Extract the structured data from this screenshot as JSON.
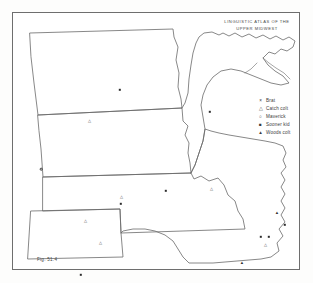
{
  "figure": {
    "title_line1": "LINGUISTIC  ATLAS  OF  THE",
    "title_line2": "UPPER  MIDWEST",
    "caption": "Fig. 51.4",
    "frame_color": "#6e6e6e",
    "ink_color": "#555555",
    "background": "#ffffff"
  },
  "legend": {
    "items": [
      {
        "symbol": "×",
        "glyph_kind": "cross",
        "label": "Brat"
      },
      {
        "symbol": "△",
        "glyph_kind": "triangle-open",
        "label": "Catch colt"
      },
      {
        "symbol": "○",
        "glyph_kind": "circle-open",
        "label": "Maverick"
      },
      {
        "symbol": "■",
        "glyph_kind": "square-filled",
        "label": "Sooner kid"
      },
      {
        "symbol": "▲",
        "glyph_kind": "triangle-filled",
        "label": "Woods colt"
      }
    ]
  },
  "map": {
    "region": "Upper Midwest",
    "states": [
      "North Dakota",
      "South Dakota",
      "Nebraska",
      "Kansas",
      "Minnesota",
      "Iowa"
    ],
    "water_features": [
      "Lake Superior"
    ],
    "borders": [
      "Canada"
    ]
  },
  "chart_data": {
    "type": "scatter",
    "title": "LINGUISTIC ATLAS OF THE UPPER MIDWEST",
    "xlabel": "",
    "ylabel": "",
    "series": [
      {
        "name": "Brat",
        "symbol": "×",
        "count": 1
      },
      {
        "name": "Catch colt",
        "symbol": "△",
        "count": 9
      },
      {
        "name": "Maverick",
        "symbol": "○",
        "count": 1
      },
      {
        "name": "Sooner kid",
        "symbol": "■",
        "count": 8
      },
      {
        "name": "Woods colt",
        "symbol": "▲",
        "count": 4
      }
    ],
    "points": [
      {
        "series": "Sooner kid",
        "x": 107,
        "y": 77,
        "state": "North Dakota"
      },
      {
        "series": "Catch colt",
        "x": 76,
        "y": 108,
        "state": "South Dakota"
      },
      {
        "series": "Maverick",
        "x": 28,
        "y": 156,
        "state": "South Dakota"
      },
      {
        "series": "Sooner kid",
        "x": 197,
        "y": 99,
        "state": "Minnesota"
      },
      {
        "series": "Catch colt",
        "x": 108,
        "y": 184,
        "state": "Nebraska"
      },
      {
        "series": "Catch colt",
        "x": 72,
        "y": 208,
        "state": "Nebraska"
      },
      {
        "series": "Sooner kid",
        "x": 108,
        "y": 191,
        "state": "Nebraska"
      },
      {
        "series": "Catch colt",
        "x": 87,
        "y": 230,
        "state": "Kansas"
      },
      {
        "series": "Sooner kid",
        "x": 68,
        "y": 262,
        "state": "Kansas"
      },
      {
        "series": "Sooner kid",
        "x": 153,
        "y": 178,
        "state": "Iowa"
      },
      {
        "series": "Catch colt",
        "x": 198,
        "y": 176,
        "state": "Iowa"
      },
      {
        "series": "Woods colt",
        "x": 264,
        "y": 200,
        "state": "Iowa"
      },
      {
        "series": "Sooner kid",
        "x": 272,
        "y": 212,
        "state": "Iowa"
      },
      {
        "series": "Sooner kid",
        "x": 248,
        "y": 224,
        "state": "Iowa"
      },
      {
        "series": "Sooner kid",
        "x": 256,
        "y": 224,
        "state": "Iowa"
      },
      {
        "series": "Catch colt",
        "x": 252,
        "y": 232,
        "state": "Iowa"
      },
      {
        "series": "Woods colt",
        "x": 229,
        "y": 250,
        "state": "Iowa"
      }
    ]
  }
}
